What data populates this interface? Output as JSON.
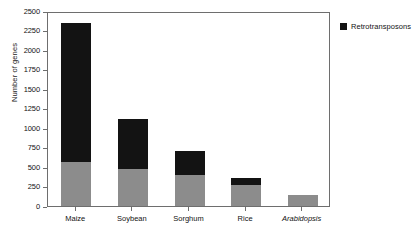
{
  "chart_data": {
    "type": "bar",
    "title": "",
    "subtitle": "",
    "xlabel": "",
    "ylabel": "Number of genes",
    "stacked": true,
    "grid": false,
    "legend_position": "right",
    "ylim": [
      0,
      2500
    ],
    "yticks": [
      0,
      250,
      500,
      750,
      1000,
      1250,
      1500,
      1750,
      2000,
      2250,
      2500
    ],
    "ytick_labels": [
      "0",
      "250",
      "500",
      "750",
      "1000",
      "1250",
      "1500",
      "1750",
      "2000",
      "2250",
      "2500"
    ],
    "categories": [
      "Maize",
      "Soybean",
      "Sorghum",
      "Rice",
      "Arabidopsis"
    ],
    "category_styles": [
      "normal",
      "normal",
      "normal",
      "normal",
      "italic"
    ],
    "series": [
      {
        "name": "Other genes",
        "color": "#8c8c8c",
        "in_legend": false,
        "values": [
          565,
          475,
          400,
          270,
          140
        ]
      },
      {
        "name": "Retrotransposons",
        "color": "#131313",
        "in_legend": true,
        "values": [
          1780,
          640,
          305,
          90,
          0
        ]
      }
    ],
    "totals": [
      2345,
      1115,
      705,
      360,
      140
    ],
    "legend": [
      {
        "label": "Retrotransposons",
        "color": "#131313"
      }
    ]
  },
  "colors": {
    "base_segment": "#8c8c8c",
    "retro_segment": "#131313",
    "axis": "#6e6e6e",
    "text": "#121212",
    "background": "#ffffff"
  }
}
